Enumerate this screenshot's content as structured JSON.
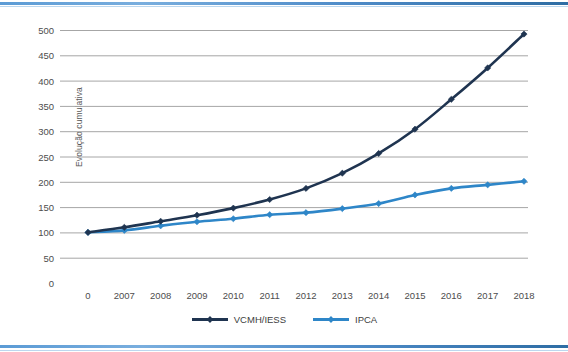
{
  "figure": {
    "background_color": "#ffffff",
    "top_rule_color": "#4f8cc9",
    "bottom_rule_color": "#4f8cc9"
  },
  "legend": {
    "position": "bottom-center",
    "entries": [
      {
        "label": "VCMH/IESS",
        "color": "#1f3450",
        "marker": "diamond"
      },
      {
        "label": "IPCA",
        "color": "#2e86c8",
        "marker": "diamond"
      }
    ]
  },
  "chart_data": {
    "type": "line",
    "title": "",
    "subtitle": "",
    "xlabel": "",
    "ylabel": "Evolução cumulativa",
    "x": [
      "0",
      "2007",
      "2008",
      "2009",
      "2010",
      "2011",
      "2012",
      "2013",
      "2014",
      "2015",
      "2016",
      "2017",
      "2018"
    ],
    "categories": [
      "0",
      "2007",
      "2008",
      "2009",
      "2010",
      "2011",
      "2012",
      "2013",
      "2014",
      "2015",
      "2016",
      "2017",
      "2018"
    ],
    "ylim": [
      0,
      500
    ],
    "ytick_labels": [
      "0",
      "50",
      "100",
      "150",
      "200",
      "250",
      "300",
      "350",
      "400",
      "450",
      "500"
    ],
    "ytick_values": [
      0,
      50,
      100,
      150,
      200,
      250,
      300,
      350,
      400,
      450,
      500
    ],
    "ytick_step": 50,
    "grid": "horizontal",
    "grid_color": "#a6a6a6",
    "legend_position": "bottom-center",
    "series": [
      {
        "name": "VCMH/IESS",
        "color": "#1f3450",
        "marker": "diamond",
        "values": [
          100,
          110,
          122,
          134,
          148,
          165,
          187,
          217,
          256,
          304,
          363,
          425,
          492
        ]
      },
      {
        "name": "IPCA",
        "color": "#2e86c8",
        "marker": "diamond",
        "values": [
          100,
          104,
          113,
          121,
          127,
          135,
          139,
          147,
          157,
          174,
          187,
          194,
          201
        ]
      }
    ]
  }
}
